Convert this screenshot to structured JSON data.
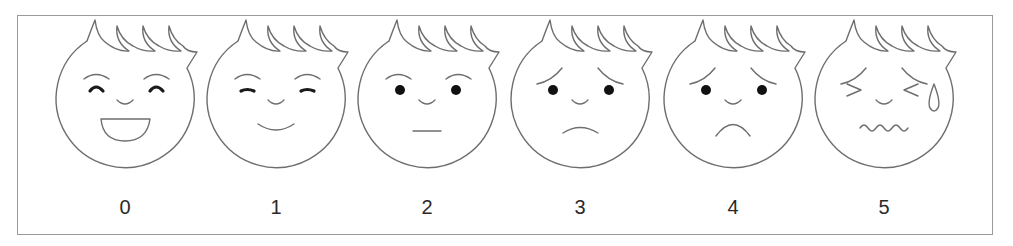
{
  "colors": {
    "outline": "#6e6e6e",
    "frame": "#9a9a9a",
    "feature": "#111111",
    "label": "#2a2a2a"
  },
  "faces": [
    {
      "score": "0",
      "center_x": 125,
      "eyes": "closed-happy",
      "brows": "arched",
      "mouth": "open-laugh",
      "extra": "none"
    },
    {
      "score": "1",
      "center_x": 276,
      "eyes": "closed-line",
      "brows": "arched",
      "mouth": "smile",
      "extra": "none"
    },
    {
      "score": "2",
      "center_x": 427,
      "eyes": "dots",
      "brows": "arched",
      "mouth": "flat-line",
      "extra": "none"
    },
    {
      "score": "3",
      "center_x": 580,
      "eyes": "dots",
      "brows": "worried",
      "mouth": "slight-frown",
      "extra": "none"
    },
    {
      "score": "4",
      "center_x": 733,
      "eyes": "dots",
      "brows": "worried",
      "mouth": "frown",
      "extra": "none"
    },
    {
      "score": "5",
      "center_x": 884,
      "eyes": "squeezed-shut",
      "brows": "worried",
      "mouth": "wavy",
      "extra": "tear-drop"
    }
  ]
}
